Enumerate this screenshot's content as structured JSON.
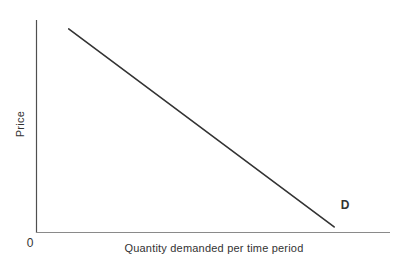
{
  "figure": {
    "ylabel": "Price",
    "xlabel": "Quantity demanded per time period",
    "origin_label": "0",
    "curve_label": "D"
  },
  "colors": {
    "background": "#ffffff",
    "axis_y": "#4f4f4f",
    "axis_x": "#8a8a8a",
    "curve": "#333333",
    "text": "#333333"
  },
  "chart_data": {
    "type": "line",
    "title": "",
    "xlabel": "Quantity demanded per time period",
    "ylabel": "Price",
    "origin_label": "0",
    "x_ticks": [],
    "y_ticks": [],
    "grid": false,
    "legend": "none",
    "axis_range_note": "Schematic economics diagram; axes carry no numeric scale. Point coordinates are normalized fractions of each axis length measured from the origin.",
    "series": [
      {
        "name": "D",
        "label": "D",
        "label_position": "right-of-lower-end",
        "points_norm": [
          {
            "x": 0.091,
            "y": 0.958
          },
          {
            "x": 0.842,
            "y": 0.026
          }
        ]
      }
    ]
  }
}
